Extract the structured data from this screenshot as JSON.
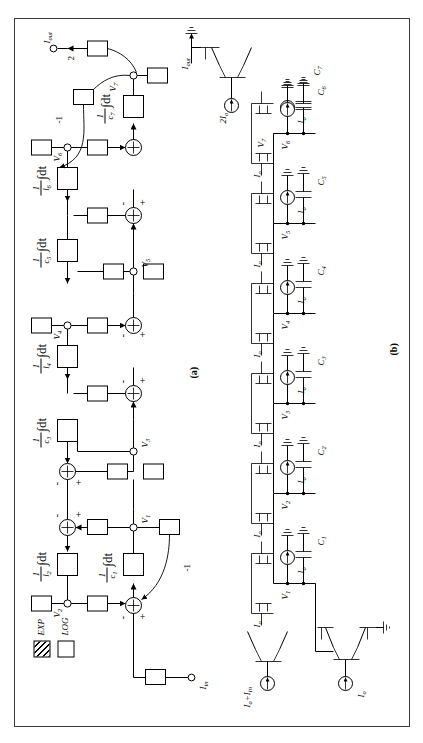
{
  "figure": {
    "panel_a_label": "(a)",
    "panel_b_label": "(b)",
    "legend": [
      {
        "symbol": "hatched-box",
        "label": "EXP"
      },
      {
        "symbol": "empty-box",
        "label": "LOG"
      }
    ]
  },
  "block_diagram": {
    "input_label": "I",
    "input_sub": "in",
    "output_label": "I",
    "output_sub": "out",
    "output_gain": "2",
    "feedback_gain_left": "-1",
    "feedback_gain_right": "-1",
    "node_labels": [
      {
        "name": "V",
        "sub": "1"
      },
      {
        "name": "V",
        "sub": "2"
      },
      {
        "name": "V",
        "sub": "3"
      },
      {
        "name": "V",
        "sub": "4"
      },
      {
        "name": "V",
        "sub": "5"
      },
      {
        "name": "V",
        "sub": "6"
      },
      {
        "name": "V",
        "sub": "7"
      }
    ],
    "integrators": [
      {
        "id": "i1",
        "numerator": "1",
        "denominator": "c",
        "den_sub": "1",
        "operator": "∫dt"
      },
      {
        "id": "i2",
        "numerator": "1",
        "denominator": "l",
        "den_sub": "2",
        "operator": "∫dt"
      },
      {
        "id": "i3",
        "numerator": "1",
        "denominator": "c",
        "den_sub": "3",
        "operator": "∫dt"
      },
      {
        "id": "i4",
        "numerator": "1",
        "denominator": "l",
        "den_sub": "4",
        "operator": "∫dt"
      },
      {
        "id": "i5",
        "numerator": "1",
        "denominator": "c",
        "den_sub": "5",
        "operator": "∫dt"
      },
      {
        "id": "i6",
        "numerator": "1",
        "denominator": "l",
        "den_sub": "6",
        "operator": "∫dt"
      },
      {
        "id": "i7",
        "numerator": "1",
        "denominator": "c",
        "den_sub": "7",
        "operator": "∫dt"
      }
    ],
    "summer_signs": [
      "-",
      "+",
      "-",
      "+",
      "-",
      "+",
      "-",
      "+",
      "-",
      "+",
      "-",
      "+"
    ]
  },
  "circuit": {
    "capacitors": [
      {
        "label": "C",
        "sub": "1"
      },
      {
        "label": "C",
        "sub": "2"
      },
      {
        "label": "C",
        "sub": "3"
      },
      {
        "label": "C",
        "sub": "4"
      },
      {
        "label": "C",
        "sub": "5"
      },
      {
        "label": "C",
        "sub": "6"
      },
      {
        "label": "C",
        "sub": "7"
      }
    ],
    "node_labels": [
      {
        "name": "V",
        "sub": "1"
      },
      {
        "name": "V",
        "sub": "2"
      },
      {
        "name": "V",
        "sub": "3"
      },
      {
        "name": "V",
        "sub": "4"
      },
      {
        "name": "V",
        "sub": "5"
      },
      {
        "name": "V",
        "sub": "6"
      },
      {
        "name": "V",
        "sub": "7"
      }
    ],
    "current_sources": [
      {
        "label": "I",
        "sub": "o"
      },
      {
        "label": "I",
        "sub": "o"
      },
      {
        "label": "I",
        "sub": "o"
      },
      {
        "label": "I",
        "sub": "o"
      },
      {
        "label": "I",
        "sub": "o"
      },
      {
        "label": "I",
        "sub": "o"
      },
      {
        "label": "I",
        "sub": "o"
      },
      {
        "label": "I",
        "sub": "o"
      },
      {
        "label": "I",
        "sub": "o"
      },
      {
        "label": "I",
        "sub": "o"
      },
      {
        "label": "I",
        "sub": "o"
      },
      {
        "label": "I",
        "sub": "o"
      },
      {
        "label": "I",
        "sub": "o"
      }
    ],
    "bias_output": {
      "label": "2I",
      "sub": "o"
    },
    "input_source": {
      "label": "I",
      "sub": "o",
      "extra": "+I",
      "extra_sub": "in"
    },
    "output_current": {
      "label": "I",
      "sub": "out"
    }
  }
}
